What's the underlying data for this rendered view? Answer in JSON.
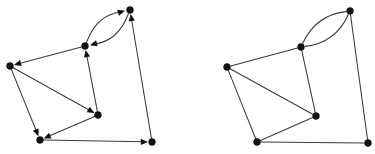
{
  "figure": {
    "title": "",
    "kind": "graph-pair-diagram",
    "width": 375,
    "height": 154,
    "background_color": "#ffffff",
    "node_color": "#111111",
    "edge_color": "#3b3b3b",
    "node_radius": 3.4,
    "edge_width": 1.05
  },
  "graphs": [
    {
      "id": "left-graph",
      "label": "",
      "directed": true,
      "node_count": 6,
      "edge_count": 9,
      "nodes": [
        {
          "id": "A",
          "label": "",
          "x": 130,
          "y": 10
        },
        {
          "id": "B",
          "label": "",
          "x": 85,
          "y": 46
        },
        {
          "id": "C",
          "label": "",
          "x": 10,
          "y": 66
        },
        {
          "id": "D",
          "label": "",
          "x": 40,
          "y": 140
        },
        {
          "id": "E",
          "label": "",
          "x": 98,
          "y": 115
        },
        {
          "id": "F",
          "label": "",
          "x": 152,
          "y": 142
        }
      ],
      "edges": [
        {
          "from": "B",
          "to": "A",
          "curve": -17,
          "arrow": true
        },
        {
          "from": "A",
          "to": "B",
          "curve": -17,
          "arrow": true
        },
        {
          "from": "B",
          "to": "C",
          "curve": 0,
          "arrow": true
        },
        {
          "from": "C",
          "to": "E",
          "curve": 0,
          "arrow": true
        },
        {
          "from": "E",
          "to": "B",
          "curve": 0,
          "arrow": true
        },
        {
          "from": "C",
          "to": "D",
          "curve": 0,
          "arrow": true
        },
        {
          "from": "E",
          "to": "D",
          "curve": 0,
          "arrow": true
        },
        {
          "from": "D",
          "to": "F",
          "curve": 0,
          "arrow": true
        },
        {
          "from": "F",
          "to": "A",
          "curve": 0,
          "arrow": true
        }
      ]
    },
    {
      "id": "right-graph",
      "label": "",
      "directed": false,
      "node_count": 6,
      "edge_count": 9,
      "nodes": [
        {
          "id": "A",
          "label": "",
          "x": 350,
          "y": 11
        },
        {
          "id": "B",
          "label": "",
          "x": 301,
          "y": 47
        },
        {
          "id": "C",
          "label": "",
          "x": 227,
          "y": 67
        },
        {
          "id": "D",
          "label": "",
          "x": 257,
          "y": 142
        },
        {
          "id": "E",
          "label": "",
          "x": 316,
          "y": 116
        },
        {
          "id": "F",
          "label": "",
          "x": 368,
          "y": 143
        }
      ],
      "edges": [
        {
          "from": "B",
          "to": "A",
          "curve": -17,
          "arrow": false
        },
        {
          "from": "A",
          "to": "B",
          "curve": -17,
          "arrow": false
        },
        {
          "from": "B",
          "to": "C",
          "curve": 0,
          "arrow": false
        },
        {
          "from": "C",
          "to": "E",
          "curve": 0,
          "arrow": false
        },
        {
          "from": "E",
          "to": "B",
          "curve": 0,
          "arrow": false
        },
        {
          "from": "C",
          "to": "D",
          "curve": 0,
          "arrow": false
        },
        {
          "from": "E",
          "to": "D",
          "curve": 0,
          "arrow": false
        },
        {
          "from": "D",
          "to": "F",
          "curve": 0,
          "arrow": false
        },
        {
          "from": "F",
          "to": "A",
          "curve": 0,
          "arrow": false
        }
      ]
    }
  ]
}
